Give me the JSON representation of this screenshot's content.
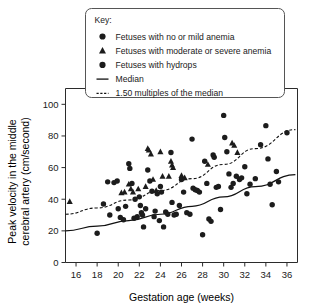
{
  "legend": {
    "title": "Key:",
    "entries": [
      {
        "marker": "circle",
        "label": "Fetuses with no or mild anemia"
      },
      {
        "marker": "triangle",
        "label": "Fetuses with moderate or severe anemia"
      },
      {
        "marker": "circle",
        "label": "Fetuses with hydrops"
      },
      {
        "marker": "solid-line",
        "label": "Median"
      },
      {
        "marker": "dashed-line",
        "label": "1.50 multiples of the median"
      }
    ]
  },
  "chart_data": {
    "type": "scatter",
    "title": "",
    "xlabel": "Gestation age (weeks)",
    "ylabel": "Peak velocity in the middle cerebral artery (cm/second)",
    "xlim": [
      15,
      37
    ],
    "ylim": [
      0,
      110
    ],
    "xticks": [
      16,
      18,
      20,
      22,
      24,
      26,
      28,
      30,
      32,
      34,
      36
    ],
    "yticks": [
      0,
      20,
      40,
      60,
      80,
      100
    ],
    "grid": false,
    "legend_position": "top",
    "series": [
      {
        "name": "Fetuses with no or mild anemia",
        "marker": "circle",
        "color": "#1c1c1c",
        "points": [
          [
            18.0,
            18.5
          ],
          [
            18.6,
            37.0
          ],
          [
            19.0,
            51.0
          ],
          [
            19.2,
            30.0
          ],
          [
            19.6,
            50.5
          ],
          [
            19.9,
            51.5
          ],
          [
            20.0,
            34.0
          ],
          [
            20.2,
            28.5
          ],
          [
            20.5,
            27.0
          ],
          [
            20.7,
            35.5
          ],
          [
            21.0,
            62.5
          ],
          [
            21.1,
            59.5
          ],
          [
            21.3,
            50.0
          ],
          [
            21.5,
            28.0
          ],
          [
            21.6,
            40.0
          ],
          [
            21.8,
            29.0
          ],
          [
            22.0,
            41.5
          ],
          [
            22.1,
            36.0
          ],
          [
            22.2,
            31.5
          ],
          [
            22.3,
            30.0
          ],
          [
            22.4,
            22.5
          ],
          [
            22.6,
            34.0
          ],
          [
            22.8,
            58.5
          ],
          [
            23.0,
            51.5
          ],
          [
            23.2,
            45.0
          ],
          [
            23.4,
            29.0
          ],
          [
            23.5,
            32.5
          ],
          [
            23.7,
            43.5
          ],
          [
            23.9,
            26.5
          ],
          [
            24.0,
            48.0
          ],
          [
            24.1,
            44.5
          ],
          [
            24.3,
            22.5
          ],
          [
            24.5,
            32.0
          ],
          [
            24.7,
            30.5
          ],
          [
            25.0,
            69.5
          ],
          [
            25.1,
            38.0
          ],
          [
            25.3,
            30.0
          ],
          [
            25.5,
            30.5
          ],
          [
            25.8,
            36.0
          ],
          [
            26.0,
            52.5
          ],
          [
            26.2,
            44.5
          ],
          [
            26.5,
            31.5
          ],
          [
            26.8,
            30.5
          ],
          [
            27.0,
            78.0
          ],
          [
            27.1,
            47.0
          ],
          [
            27.3,
            46.0
          ],
          [
            27.5,
            45.5
          ],
          [
            27.7,
            44.5
          ],
          [
            28.0,
            17.5
          ],
          [
            28.2,
            64.0
          ],
          [
            28.4,
            50.0
          ],
          [
            28.6,
            27.5
          ],
          [
            28.8,
            26.0
          ],
          [
            29.0,
            68.0
          ],
          [
            29.1,
            66.5
          ],
          [
            29.3,
            47.5
          ],
          [
            29.5,
            48.0
          ],
          [
            29.7,
            33.5
          ],
          [
            30.0,
            93.0
          ],
          [
            30.1,
            79.0
          ],
          [
            30.3,
            70.0
          ],
          [
            30.5,
            56.0
          ],
          [
            30.7,
            47.5
          ],
          [
            30.9,
            50.0
          ],
          [
            31.2,
            54.5
          ],
          [
            31.5,
            52.5
          ],
          [
            31.7,
            53.5
          ],
          [
            32.0,
            60.5
          ],
          [
            32.2,
            43.5
          ],
          [
            32.5,
            49.5
          ],
          [
            33.0,
            53.0
          ],
          [
            33.5,
            74.5
          ],
          [
            34.0,
            86.5
          ],
          [
            34.2,
            65.5
          ],
          [
            34.4,
            49.5
          ],
          [
            34.6,
            36.5
          ],
          [
            35.0,
            57.5
          ],
          [
            35.2,
            51.0
          ],
          [
            36.0,
            82.0
          ]
        ]
      },
      {
        "name": "Fetuses with moderate or severe anemia",
        "marker": "triangle",
        "color": "#1c1c1c",
        "points": [
          [
            15.4,
            38.5
          ],
          [
            20.3,
            44.0
          ],
          [
            20.6,
            44.5
          ],
          [
            21.0,
            49.5
          ],
          [
            21.2,
            46.5
          ],
          [
            21.4,
            44.5
          ],
          [
            21.9,
            46.5
          ],
          [
            22.6,
            48.0
          ],
          [
            22.8,
            72.0
          ],
          [
            22.9,
            71.0
          ],
          [
            23.1,
            68.5
          ],
          [
            23.3,
            52.5
          ],
          [
            23.6,
            45.5
          ],
          [
            24.0,
            70.0
          ],
          [
            24.2,
            54.5
          ],
          [
            24.8,
            54.5
          ],
          [
            25.0,
            64.0
          ],
          [
            25.1,
            61.5
          ],
          [
            25.2,
            60.0
          ],
          [
            26.0,
            55.0
          ],
          [
            26.3,
            53.5
          ],
          [
            28.5,
            62.0
          ],
          [
            30.8,
            75.5
          ],
          [
            31.0,
            74.0
          ],
          [
            31.3,
            69.5
          ]
        ]
      },
      {
        "name": "Fetuses with hydrops",
        "marker": "circle",
        "color": "#1c1c1c",
        "points": []
      }
    ],
    "curves": [
      {
        "name": "Median",
        "style": "solid",
        "points": [
          [
            15.0,
            20.0
          ],
          [
            18.0,
            23.0
          ],
          [
            21.0,
            26.5
          ],
          [
            24.0,
            30.5
          ],
          [
            27.0,
            35.5
          ],
          [
            30.0,
            41.5
          ],
          [
            33.0,
            48.0
          ],
          [
            36.8,
            55.5
          ]
        ]
      },
      {
        "name": "1.50 multiples of the median",
        "style": "dashed",
        "points": [
          [
            15.0,
            30.5
          ],
          [
            18.0,
            34.5
          ],
          [
            21.0,
            39.5
          ],
          [
            24.0,
            45.5
          ],
          [
            27.0,
            53.0
          ],
          [
            30.0,
            62.0
          ],
          [
            33.0,
            72.0
          ],
          [
            36.8,
            84.0
          ]
        ]
      }
    ]
  }
}
